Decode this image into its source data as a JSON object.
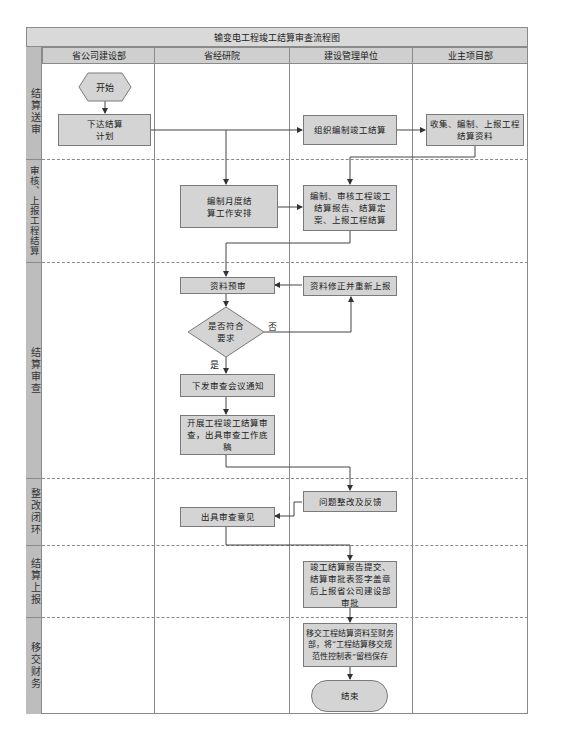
{
  "diagram": {
    "title": "输变电工程竣工结算审查流程图",
    "columns": [
      {
        "label": "省公司建设部"
      },
      {
        "label": "省经研院"
      },
      {
        "label": "建设管理单位"
      },
      {
        "label": "业主项目部"
      }
    ],
    "phases": [
      {
        "label": "结算送审"
      },
      {
        "label": "审核、上报工程结算"
      },
      {
        "label": "结算审查"
      },
      {
        "label": "整改闭环"
      },
      {
        "label": "结算上报"
      },
      {
        "label": "移交财务"
      }
    ],
    "nodes": {
      "start": "开始",
      "issue_plan": "下达结算计划",
      "organize_settlement": "组织编制竣工结算",
      "collect_materials": "收集、编制、上报工程结算资料",
      "monthly_arrangement": "编制月度结算工作安排",
      "compile_report": "编制、审核工程竣工结算报告、结算定案、上报工程结算",
      "pre_review": "资料预审",
      "revise_resubmit": "资料修正并重新上报",
      "decision": "是否符合要求",
      "decision_no": "否",
      "decision_yes": "是",
      "meeting_notice": "下发审查会议通知",
      "conduct_review": "开展工程竣工结算审查，出具审查工作底稿",
      "rectify_feedback": "问题整改及反馈",
      "issue_opinion": "出具审查意见",
      "submit_report": "竣工结算报告提交、结算审批表签字盖章后上报省公司建设部审批",
      "transfer_finance": "移交工程结算资料至财务部，将“工程结算移交规范性控制表”留档保存",
      "end": "结束"
    }
  }
}
